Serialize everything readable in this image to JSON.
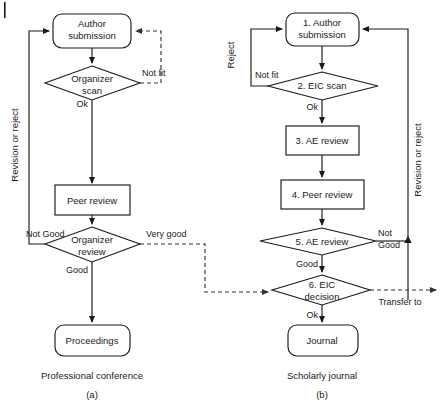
{
  "figure": {
    "line_color": "#1a1a1a",
    "dash_color": "#333333",
    "background": "#ffffff"
  },
  "panel_a": {
    "caption_title": "Professional conference",
    "caption_letter": "(a)",
    "side_label": "Revision or reject",
    "nodes": [
      {
        "id": "a-author-submission",
        "label_line1": "Author",
        "label_line2": "submission",
        "shape": "rounded-rect"
      },
      {
        "id": "a-organizer-scan",
        "label_line1": "Organizer",
        "label_line2": "scan",
        "shape": "diamond"
      },
      {
        "id": "a-peer-review",
        "label_line1": "Peer review",
        "label_line2": "",
        "shape": "rect"
      },
      {
        "id": "a-organizer-review",
        "label_line1": "Organizer",
        "label_line2": "review",
        "shape": "diamond"
      },
      {
        "id": "a-proceedings",
        "label_line1": "Proceedings",
        "label_line2": "",
        "shape": "rounded-rect"
      }
    ],
    "edge_labels": {
      "not_fit": "Not fit",
      "ok": "Ok",
      "not_good": "Not Good",
      "very_good": "Very good",
      "good": "Good"
    }
  },
  "panel_b": {
    "caption_title": "Scholarly journal",
    "caption_letter": "(b)",
    "side_label_left": "Reject",
    "side_label_right": "Revision or reject",
    "transfer_label": "Transfer to",
    "nodes": [
      {
        "id": "b-author-submission",
        "label_line1": "1. Author",
        "label_line2": "submission",
        "shape": "rounded-rect"
      },
      {
        "id": "b-eic-scan",
        "label_line1": "2. EIC scan",
        "label_line2": "",
        "shape": "diamond"
      },
      {
        "id": "b-ae-review",
        "label_line1": "3. AE review",
        "label_line2": "",
        "shape": "rect"
      },
      {
        "id": "b-peer-review",
        "label_line1": "4. Peer review",
        "label_line2": "",
        "shape": "rect"
      },
      {
        "id": "b-ae-decision",
        "label_line1": "5. AE review",
        "label_line2": "",
        "shape": "diamond"
      },
      {
        "id": "b-eic-decision",
        "label_line1": "6. EIC",
        "label_line2": "decision",
        "shape": "diamond"
      },
      {
        "id": "b-journal",
        "label_line1": "Journal",
        "label_line2": "",
        "shape": "rounded-rect"
      }
    ],
    "edge_labels": {
      "not_fit": "Not fit",
      "ok_scan": "Ok",
      "good": "Good",
      "not_good_line1": "Not",
      "not_good_line2": "Good",
      "ok_decision": "Ok"
    }
  }
}
